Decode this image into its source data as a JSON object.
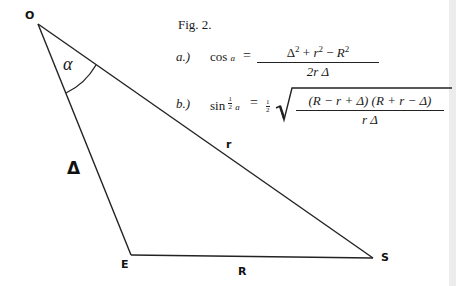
{
  "figure": {
    "caption": "Fig. 2.",
    "vertices": {
      "O": {
        "label": "O",
        "x": 38,
        "y": 24
      },
      "E": {
        "label": "E",
        "x": 131,
        "y": 255
      },
      "S": {
        "label": "S",
        "x": 373,
        "y": 258
      }
    },
    "sides": {
      "OE": {
        "label": "Δ"
      },
      "OS": {
        "label": "r"
      },
      "ES": {
        "label": "R"
      }
    },
    "angle": {
      "label": "α",
      "vertex": "O"
    },
    "stroke_color": "#222222"
  },
  "formulas": {
    "a": {
      "prefix": "a.)",
      "lhs": "cos",
      "lhs_var": "a",
      "equals": "=",
      "numerator": {
        "t1": "Δ",
        "e1": "2",
        "op1": "+",
        "t2": "r",
        "e2": "2",
        "op2": "−",
        "t3": "R",
        "e3": "2"
      },
      "denominator": "2r Δ"
    },
    "b": {
      "prefix": "b.)",
      "lhs": "sin",
      "half_num": "1",
      "half_den": "2",
      "lhs_var": "a",
      "equals": "=",
      "coef_num": "1",
      "coef_den": "2",
      "numerator": "(R − r + Δ) (R + r − Δ)",
      "denominator": "r Δ"
    }
  }
}
